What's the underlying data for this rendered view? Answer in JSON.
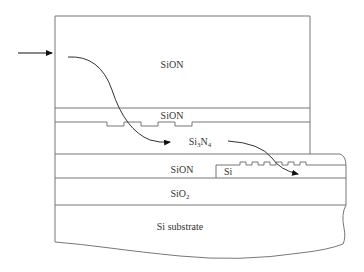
{
  "diagram": {
    "title": "",
    "colors": {
      "stroke": "#777777",
      "text": "#333333",
      "background": "#ffffff",
      "arrow": "#111111"
    },
    "layers": [
      {
        "id": "top-cladding",
        "label": "SiON"
      },
      {
        "id": "thin-sion",
        "label": "SiON"
      },
      {
        "id": "core",
        "label_main": "Si",
        "label_sub1": "3",
        "label_mid": "N",
        "label_sub2": "4"
      },
      {
        "id": "lower-sion",
        "label": "SiON"
      },
      {
        "id": "si-waveguide",
        "label": "Si"
      },
      {
        "id": "buried-oxide",
        "label_main": "SiO",
        "label_sub": "2"
      },
      {
        "id": "substrate",
        "label": "Si substrate"
      }
    ],
    "arrows": [
      {
        "id": "input-light",
        "description": "incident light arrow"
      },
      {
        "id": "coupling-path-1",
        "description": "light path from SiON into Si3N4 core"
      },
      {
        "id": "coupling-path-2",
        "description": "light path from Si3N4 into Si waveguide"
      }
    ]
  }
}
